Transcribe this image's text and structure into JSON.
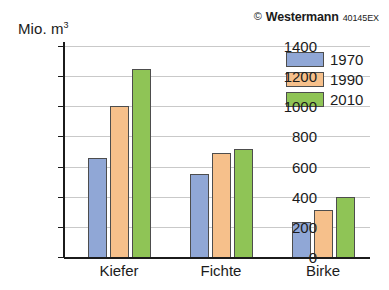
{
  "credit": {
    "mark": "©",
    "publisher": "Westermann",
    "code": "40145EX"
  },
  "axis_unit": {
    "prefix": "Mio. m",
    "exponent": "3"
  },
  "chart_data": {
    "type": "bar",
    "title": "",
    "xlabel": "",
    "ylabel": "Mio. m3",
    "ylim": [
      0,
      1400
    ],
    "ytick_step": 200,
    "yticks": [
      "1400",
      "1200",
      "1000",
      "800",
      "600",
      "400",
      "200",
      "0"
    ],
    "grid": true,
    "legend_position": "top-right",
    "categories": [
      "Kiefer",
      "Fichte",
      "Birke"
    ],
    "series": [
      {
        "name": "1970",
        "color": "#90a7d6",
        "values": [
          660,
          550,
          235
        ]
      },
      {
        "name": "1990",
        "color": "#f6c08b",
        "values": [
          1000,
          690,
          310
        ]
      },
      {
        "name": "2010",
        "color": "#8fc456",
        "values": [
          1250,
          720,
          400
        ]
      }
    ]
  }
}
